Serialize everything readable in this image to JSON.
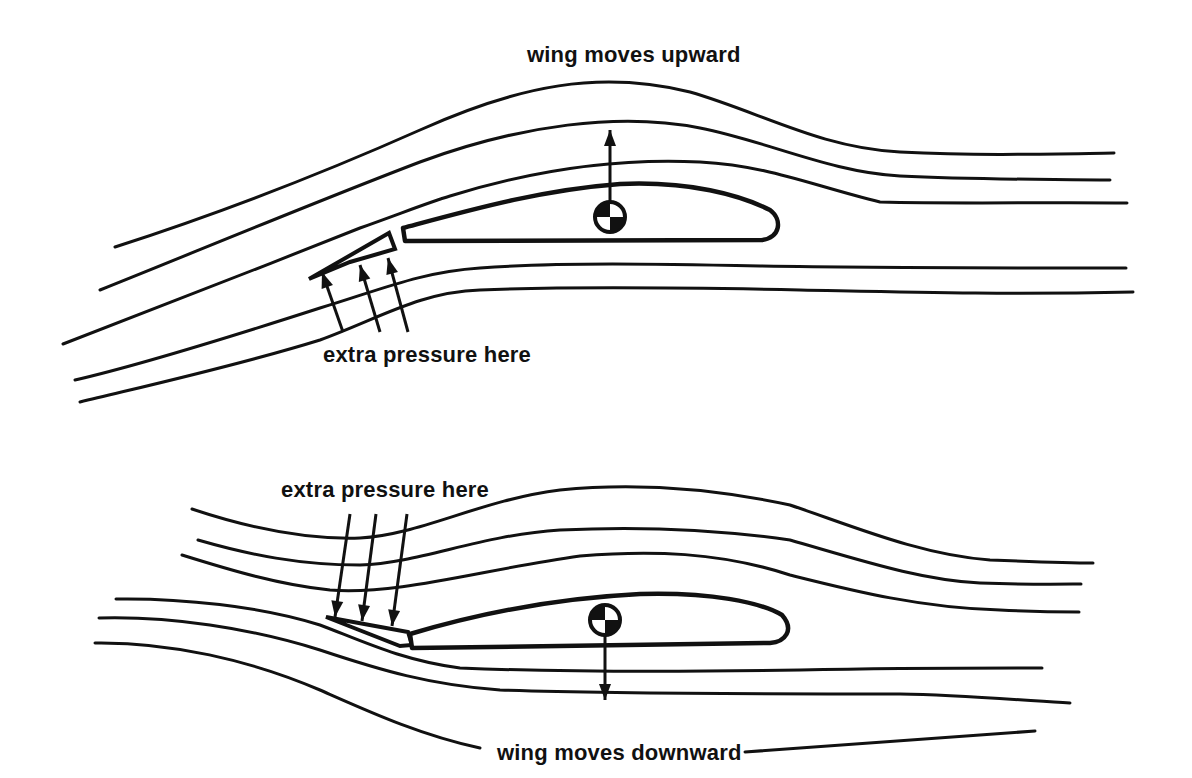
{
  "diagram": {
    "colors": {
      "ink": "#111111",
      "background": "#ffffff"
    },
    "panels": [
      {
        "id": "upper",
        "top_label": {
          "text": "wing moves upward",
          "x": 527,
          "y": 62
        },
        "pressure_label": {
          "text": "extra pressure here",
          "x": 323,
          "y": 362
        },
        "streamlines": [
          "M115,247 C230,210 330,170 420,130 C520,85 600,70 690,92 C760,112 820,148 900,152 C980,156 1050,154 1114,153",
          "M100,290 C200,250 320,200 420,162 C520,125 620,112 700,128 C770,142 830,172 900,176 C980,180 1050,179 1110,180",
          "M63,344 C150,310 260,268 360,228 C410,210 430,202 450,196 C540,168 620,158 700,162 C770,166 810,185 880,202 C960,204 1050,202 1127,203",
          "M75,380 C140,365 230,337 320,308 C380,290 420,272 480,268 C560,262 660,264 760,266 C880,268 1000,268 1126,268",
          "M80,402 C150,385 240,365 320,340 C380,318 420,292 480,290 C580,286 700,288 800,290 C900,292 1000,295 1133,292"
        ],
        "slat": "M309,279 L389,233 L395,249 L350,262 Z",
        "wing": "M403,228 C470,210 540,190 620,184 C690,181 740,195 770,210 C783,220 780,238 762,240 L405,241 Z",
        "cg": {
          "x": 610,
          "y": 217,
          "r": 15
        },
        "force_arrow": {
          "x": 610,
          "y1": 202,
          "y2": 130,
          "direction": "up"
        },
        "pressure_arrows": [
          {
            "x1": 343,
            "y1": 332,
            "x2": 322,
            "y2": 272
          },
          {
            "x1": 380,
            "y1": 332,
            "x2": 360,
            "y2": 265
          },
          {
            "x1": 408,
            "y1": 332,
            "x2": 388,
            "y2": 258
          }
        ]
      },
      {
        "id": "lower",
        "top_label": {
          "text": "extra pressure here",
          "x": 281,
          "y": 497
        },
        "bottom_label": {
          "text": "wing moves downward",
          "x": 497,
          "y": 760
        },
        "bottom_label_lines": [
          {
            "x1": 100,
            "y1": 725,
            "x2": 487,
            "y2": 752,
            "path": "M95,643 C180,648 260,675 340,710 C390,735 430,750 487,752"
          },
          {
            "x1": 745,
            "y1": 752,
            "x2": 1035,
            "y2": 731
          }
        ],
        "streamlines": [
          "M192,509 C240,525 300,540 360,538 C420,535 480,500 560,490 C640,482 720,490 790,505 C850,525 920,555 990,560 C1040,562 1080,563 1093,563",
          "M198,540 C250,555 300,565 360,565 C420,563 480,535 560,530 C640,526 720,530 790,540 C860,560 920,580 980,583 C1040,585 1070,584 1081,584",
          "M182,555 C230,570 280,585 330,590 C400,595 480,570 580,556 C650,550 720,552 790,575 C850,590 920,608 1000,610 C1040,612 1070,612 1079,612",
          "M116,599 C180,598 260,606 320,625 C360,640 400,660 460,668 C560,672 680,672 800,670 C900,668 980,668 1042,668",
          "M99,618 C170,616 250,628 320,650 C380,670 430,685 500,690 C620,694 760,694 900,694 C960,695 1020,700 1070,703",
          "M95,643 C170,642 250,660 320,690 C370,712 420,735 480,748"
        ],
        "slat": "M326,617 L408,632 L412,645 L400,646 Z",
        "wing": "M410,634 C480,613 560,598 640,594 C710,592 760,602 782,615 C795,630 785,642 770,643 L412,648 Z",
        "cg": {
          "x": 605,
          "y": 620,
          "r": 15
        },
        "force_arrow": {
          "x": 605,
          "y1": 635,
          "y2": 700,
          "direction": "down"
        },
        "pressure_arrows": [
          {
            "x1": 350,
            "y1": 514,
            "x2": 335,
            "y2": 617
          },
          {
            "x1": 376,
            "y1": 514,
            "x2": 362,
            "y2": 621
          },
          {
            "x1": 407,
            "y1": 514,
            "x2": 392,
            "y2": 626
          }
        ]
      }
    ]
  }
}
